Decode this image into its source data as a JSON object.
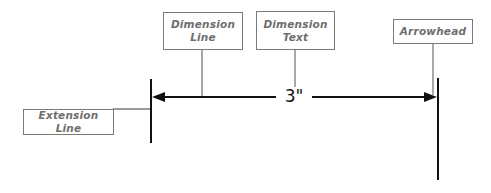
{
  "diagram": {
    "labels": {
      "dimension_line": "Dimension Line",
      "dimension_line_l1": "Dimension",
      "dimension_line_l2": "Line",
      "dimension_text": "Dimension Text",
      "dimension_text_l1": "Dimension",
      "dimension_text_l2": "Text",
      "arrowhead": "Arrowhead",
      "extension_line": "Extension Line"
    },
    "dimension_value": "3\"",
    "colors": {
      "geometry": "#111111",
      "callout_border": "#7a7a7a",
      "callout_text": "#6e6e6e",
      "background": "#ffffff"
    }
  }
}
